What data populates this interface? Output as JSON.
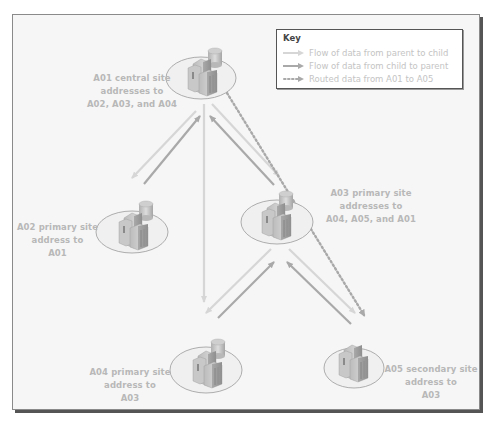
{
  "colors": {
    "parent_to_child": "#d6d6d6",
    "child_to_parent": "#a9a9a9",
    "routed": "#a9a9a9",
    "label_text": "#b8b8b8",
    "background": "#f6f6f6"
  },
  "key": {
    "title": "Key",
    "items": [
      {
        "type": "parent-to-child",
        "label": "Flow of data from parent to child"
      },
      {
        "type": "child-to-parent",
        "label": "Flow of data from child to parent"
      },
      {
        "type": "routed",
        "label": "Routed data from A01 to A05"
      }
    ]
  },
  "sites": [
    {
      "id": "A01",
      "kind": "central",
      "has_database": true,
      "label_lines": [
        "A01 central site",
        "addresses to",
        "A02, A03, and A04"
      ]
    },
    {
      "id": "A02",
      "kind": "primary",
      "has_database": true,
      "label_lines": [
        "A02 primary site",
        "address to",
        "A01"
      ]
    },
    {
      "id": "A03",
      "kind": "primary",
      "has_database": true,
      "label_lines": [
        "A03 primary site",
        "addresses to",
        "A04, A05, and A01"
      ]
    },
    {
      "id": "A04",
      "kind": "primary",
      "has_database": true,
      "label_lines": [
        "A04 primary site",
        "address to",
        "A03"
      ]
    },
    {
      "id": "A05",
      "kind": "secondary",
      "has_database": false,
      "label_lines": [
        "A05 secondary site",
        "address to",
        "A03"
      ]
    }
  ]
}
